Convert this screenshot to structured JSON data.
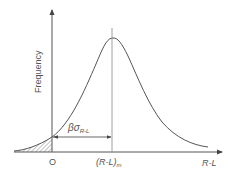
{
  "diagram": {
    "type": "frequency-distribution",
    "y_axis_label": "Frequency",
    "x_axis_label": "R-L",
    "origin_label": "O",
    "mean_label": {
      "main": "(R-L)",
      "subscript": "m"
    },
    "margin_label": {
      "beta": "β",
      "sigma": "σ",
      "subscript": "R-L"
    },
    "colors": {
      "line": "#555555",
      "hatch": "#777777",
      "background": "#ffffff"
    }
  }
}
